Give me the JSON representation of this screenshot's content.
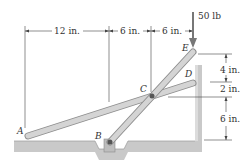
{
  "figure": {
    "load": {
      "label": "50 lb",
      "point": "E"
    },
    "points": {
      "A": "A",
      "B": "B",
      "C": "C",
      "D": "D",
      "E": "E"
    },
    "horizontal_dims": [
      {
        "label": "12 in.",
        "from": "A",
        "to": "B"
      },
      {
        "label": "6 in.",
        "from": "B",
        "to": "C"
      },
      {
        "label": "6 in.",
        "from": "C",
        "to": "E"
      }
    ],
    "vertical_dims": [
      {
        "label": "4 in.",
        "from": "E",
        "to": "D"
      },
      {
        "label": "2 in.",
        "from": "D",
        "to": "C"
      },
      {
        "label": "6 in.",
        "from": "C",
        "to": "floor"
      }
    ]
  }
}
